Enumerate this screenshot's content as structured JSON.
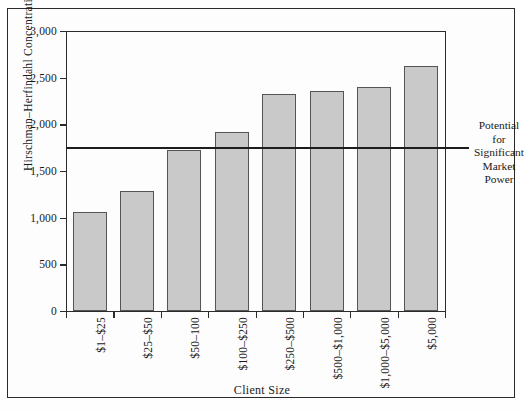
{
  "figure": {
    "ylabel": "Hirschman–Herfindahl Concentration",
    "xlabel": "Client Size"
  },
  "annotation": {
    "lines": [
      "Potential",
      "for",
      "Significant",
      "Market",
      "Power"
    ]
  },
  "chart_data": {
    "type": "bar",
    "title": "",
    "xlabel": "Client Size",
    "ylabel": "Hirschman–Herfindahl Concentration",
    "categories": [
      "$1–$25",
      "$25–$50",
      "$50–100",
      "$100–$250",
      "$250–$500",
      "$500–$1,000",
      "$1,000–$5,000",
      "$5,000"
    ],
    "values": [
      1060,
      1285,
      1730,
      1920,
      2320,
      2360,
      2400,
      2620
    ],
    "ylim": [
      0,
      3000
    ],
    "yticks": [
      0,
      500,
      1000,
      1500,
      2000,
      2500,
      3000
    ],
    "ytick_labels": [
      "0",
      "500",
      "1,000",
      "1,500",
      "2,000",
      "2,500",
      "3,000"
    ],
    "grid": false,
    "legend": "none",
    "bar_color": "#c9c9c9",
    "bar_edge_color": "#555555",
    "annotations": [
      {
        "type": "hline",
        "value": 1760,
        "label": "Potential for Significant Market Power",
        "color": "#1d1d1d"
      }
    ]
  }
}
